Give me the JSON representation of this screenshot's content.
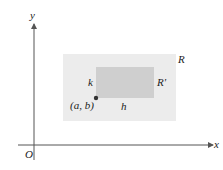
{
  "diagram": {
    "type": "coordinate-plane-region",
    "axes": {
      "x_label": "x",
      "y_label": "y",
      "origin_label": "O"
    },
    "regions": [
      {
        "id": "outer",
        "label": "R",
        "fill": "#ececec"
      },
      {
        "id": "inner",
        "label": "R'",
        "fill": "#cfcfcf"
      }
    ],
    "point": {
      "label": "(a, b)",
      "color": "#333333"
    },
    "dimensions": {
      "width_label": "h",
      "height_label": "k"
    },
    "colors": {
      "axis": "#555555",
      "outer_region": "#ececec",
      "inner_region": "#cfcfcf",
      "point": "#333333",
      "text": "#222222"
    }
  }
}
